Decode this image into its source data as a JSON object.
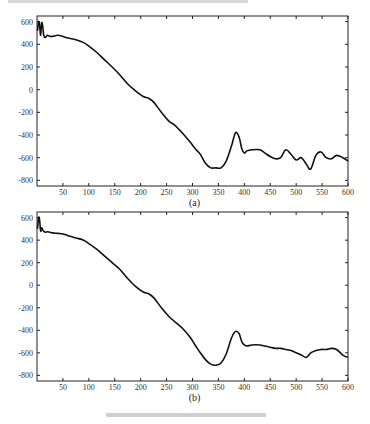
{
  "chart_data": [
    {
      "type": "line",
      "panel_label": "(a)",
      "xlabel": "",
      "ylabel": "",
      "xlim": [
        0,
        600
      ],
      "ylim": [
        -850,
        650
      ],
      "xticks": [
        50,
        100,
        150,
        200,
        250,
        300,
        350,
        400,
        450,
        500,
        550,
        600
      ],
      "yticks": [
        -800,
        -600,
        -400,
        -200,
        0,
        200,
        400,
        600
      ],
      "grid": false,
      "series": [
        {
          "name": "curve",
          "x": [
            1,
            3,
            5,
            7,
            9,
            11,
            13,
            16,
            20,
            25,
            30,
            40,
            50,
            60,
            75,
            90,
            100,
            115,
            130,
            145,
            160,
            175,
            190,
            205,
            215,
            225,
            240,
            255,
            265,
            280,
            295,
            305,
            315,
            325,
            335,
            345,
            355,
            365,
            375,
            383,
            390,
            395,
            400,
            405,
            415,
            430,
            440,
            450,
            460,
            470,
            480,
            490,
            500,
            510,
            520,
            528,
            538,
            548,
            558,
            568,
            578,
            590,
            600
          ],
          "y": [
            520,
            600,
            570,
            480,
            590,
            560,
            480,
            460,
            480,
            470,
            470,
            480,
            470,
            455,
            440,
            415,
            385,
            330,
            265,
            200,
            130,
            50,
            -10,
            -60,
            -75,
            -110,
            -200,
            -280,
            -310,
            -380,
            -460,
            -520,
            -570,
            -650,
            -690,
            -690,
            -690,
            -630,
            -500,
            -380,
            -420,
            -520,
            -560,
            -540,
            -530,
            -530,
            -560,
            -590,
            -610,
            -600,
            -530,
            -570,
            -620,
            -600,
            -660,
            -700,
            -580,
            -550,
            -600,
            -610,
            -580,
            -600,
            -630
          ]
        }
      ]
    },
    {
      "type": "line",
      "panel_label": "(b)",
      "xlabel": "",
      "ylabel": "",
      "xlim": [
        0,
        600
      ],
      "ylim": [
        -850,
        650
      ],
      "xticks": [
        50,
        100,
        150,
        200,
        250,
        300,
        350,
        400,
        450,
        500,
        550,
        600
      ],
      "yticks": [
        -800,
        -600,
        -400,
        -200,
        0,
        200,
        400,
        600
      ],
      "grid": false,
      "series": [
        {
          "name": "curve",
          "x": [
            1,
            3,
            5,
            7,
            9,
            11,
            13,
            16,
            20,
            25,
            30,
            40,
            50,
            60,
            75,
            90,
            100,
            115,
            130,
            145,
            160,
            175,
            190,
            205,
            215,
            225,
            240,
            255,
            265,
            280,
            295,
            305,
            315,
            325,
            335,
            345,
            355,
            365,
            375,
            383,
            390,
            395,
            400,
            405,
            415,
            430,
            440,
            450,
            460,
            470,
            480,
            490,
            500,
            510,
            520,
            528,
            538,
            548,
            558,
            568,
            578,
            590,
            600
          ],
          "y": [
            500,
            600,
            580,
            480,
            510,
            490,
            480,
            470,
            475,
            470,
            465,
            460,
            455,
            440,
            420,
            400,
            370,
            320,
            260,
            200,
            140,
            60,
            -10,
            -60,
            -75,
            -110,
            -200,
            -280,
            -320,
            -380,
            -460,
            -530,
            -600,
            -660,
            -700,
            -710,
            -690,
            -610,
            -470,
            -410,
            -430,
            -500,
            -530,
            -540,
            -530,
            -530,
            -540,
            -550,
            -560,
            -560,
            -570,
            -580,
            -600,
            -620,
            -640,
            -600,
            -580,
            -570,
            -570,
            -560,
            -570,
            -620,
            -640
          ]
        }
      ]
    }
  ],
  "header_text_visible": false,
  "caption_text_visible": false
}
